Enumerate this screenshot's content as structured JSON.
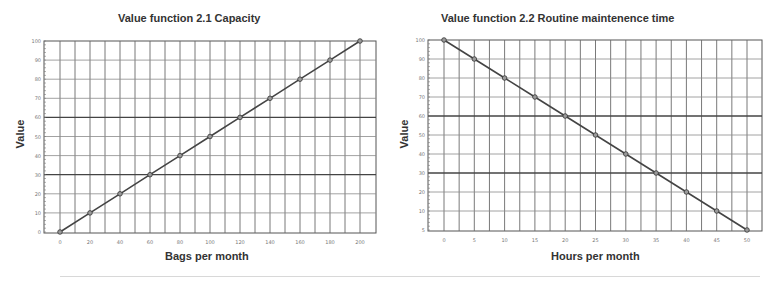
{
  "chart_data": [
    {
      "type": "line",
      "title": "Value function 2.1 Capacity",
      "xlabel": "Bags per month",
      "ylabel": "Value",
      "x": [
        0,
        20,
        40,
        60,
        80,
        100,
        120,
        140,
        160,
        180,
        200
      ],
      "series": [
        {
          "name": "Value",
          "values": [
            0,
            10,
            20,
            30,
            40,
            50,
            60,
            70,
            80,
            90,
            100
          ]
        }
      ],
      "xticks": [
        "0",
        "20",
        "40",
        "60",
        "80",
        "100",
        "120",
        "140",
        "160",
        "180",
        "200"
      ],
      "yticks": [
        "0",
        "10",
        "20",
        "30",
        "40",
        "50",
        "60",
        "70",
        "80",
        "90",
        "100"
      ],
      "xlim": [
        0,
        200
      ],
      "ylim": [
        0,
        100
      ],
      "grid": true,
      "markers": "circle",
      "line_color": "#444444"
    },
    {
      "type": "line",
      "title": "Value function 2.2 Routine maintenence time",
      "xlabel": "Hours per month",
      "ylabel": "Value",
      "x": [
        0,
        5,
        10,
        15,
        20,
        25,
        30,
        35,
        40,
        45,
        50
      ],
      "series": [
        {
          "name": "Value",
          "values": [
            100,
            90,
            80,
            70,
            60,
            50,
            40,
            30,
            20,
            10,
            0
          ]
        }
      ],
      "xticks": [
        "0",
        "5",
        "10",
        "15",
        "20",
        "25",
        "30",
        "35",
        "40",
        "45",
        "50"
      ],
      "yticks": [
        "5",
        "10",
        "20",
        "30",
        "40",
        "50",
        "60",
        "70",
        "80",
        "90",
        "100"
      ],
      "xlim": [
        0,
        50
      ],
      "ylim": [
        0,
        100
      ],
      "grid": true,
      "markers": "circle",
      "line_color": "#444444"
    }
  ]
}
